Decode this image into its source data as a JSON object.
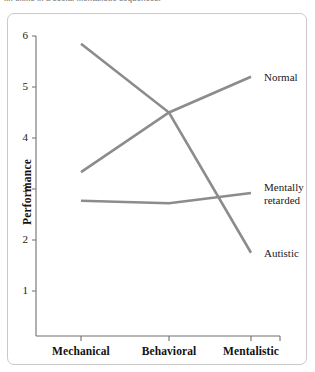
{
  "caption": {
    "text": "...: skills in a social mentalistic sequences."
  },
  "chart_data": {
    "type": "line",
    "title": "",
    "xlabel": "",
    "ylabel": "Performance",
    "categories": [
      "Mechanical",
      "Behavioral",
      "Mentalistic"
    ],
    "ylim": [
      0,
      6
    ],
    "yticks": [
      1,
      2,
      3,
      4,
      5,
      6
    ],
    "ytick_labels": [
      "1",
      "2",
      "3",
      "4",
      "5",
      "6"
    ],
    "grid": false,
    "legend_position": "right-inline",
    "line_color": "#8c8c8c",
    "axis_color": "#6f6f6f",
    "series": [
      {
        "name": "Normal",
        "label": "Normal",
        "values": [
          3.33,
          4.5,
          5.2
        ]
      },
      {
        "name": "Mentally retarded",
        "label": "Mentally\nretarded",
        "values": [
          2.77,
          2.72,
          2.92
        ]
      },
      {
        "name": "Autistic",
        "label": "Autistic",
        "values": [
          5.85,
          4.5,
          1.75
        ]
      }
    ]
  }
}
